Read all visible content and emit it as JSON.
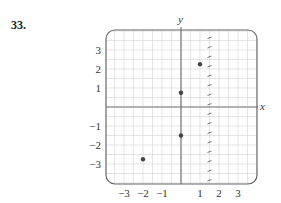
{
  "problem": {
    "number": "33."
  },
  "chart_data": {
    "type": "scatter",
    "title": "",
    "xlabel": "x",
    "ylabel": "y",
    "xlim": [
      -4,
      4
    ],
    "ylim": [
      -4,
      4
    ],
    "grid": true,
    "grid_step": 0.5,
    "x_ticks": [
      -3,
      -2,
      -1,
      1,
      2,
      3
    ],
    "y_ticks": [
      -3,
      -2,
      -1,
      1,
      2,
      3
    ],
    "x_tick_labels": [
      "−3",
      "−2",
      "−1",
      "1",
      "2",
      "3"
    ],
    "y_tick_labels": [
      "−3",
      "−2",
      "−1",
      "1",
      "2",
      "3"
    ],
    "points": [
      {
        "x": -2,
        "y": -2.75
      },
      {
        "x": 0,
        "y": -1.5
      },
      {
        "x": 0,
        "y": 0.75
      },
      {
        "x": 1,
        "y": 2.25
      }
    ],
    "dashed_vertical_line": {
      "x": 1.5,
      "style": "dashed"
    },
    "colors": {
      "grid": "#d8d8d8",
      "axis": "#777777",
      "frame": "#666666",
      "point": "#444444",
      "dashed_line": "#666666"
    }
  }
}
